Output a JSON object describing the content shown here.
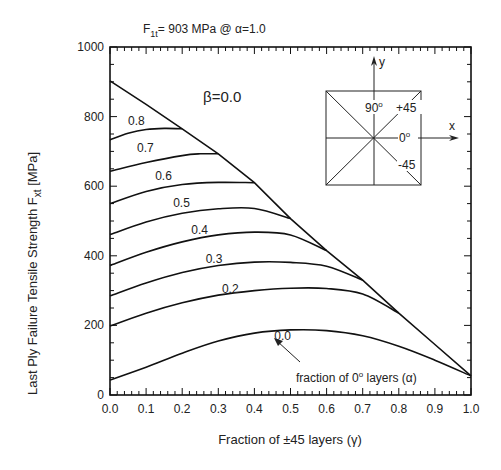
{
  "chart_data": {
    "type": "line",
    "title": "F1t= 903 MPa @ α=1.0",
    "title_parts": {
      "main": "F",
      "sub": "1t",
      "rest": "= 903 MPa @ α=1.0"
    },
    "xlabel": "Fraction of ±45 layers (γ)",
    "ylabel": "Last Ply Failure Tensile Strength  Fxt [MPa]",
    "ylabel_parts": {
      "main": "Last Ply Failure Tensile Strength  F",
      "sub": "xt",
      "rest": " [MPa]"
    },
    "xlim": [
      0.0,
      1.0
    ],
    "ylim": [
      0,
      1000
    ],
    "x_ticks": [
      "0.0",
      "0.1",
      "0.2",
      "0.3",
      "0.4",
      "0.5",
      "0.6",
      "0.7",
      "0.8",
      "0.9",
      "1.0"
    ],
    "y_ticks": [
      "0",
      "200",
      "400",
      "600",
      "800",
      "1000"
    ],
    "grid": false,
    "annotations": {
      "beta": "β=0.0",
      "alpha_note_prefix": "fraction of 0",
      "alpha_note_sup": "o",
      "alpha_note_suffix": " layers (α)"
    },
    "inset": {
      "y_axis": "y",
      "x_axis": "x",
      "label_90": "90",
      "label_90_sup": "o",
      "label_p45": "+45",
      "label_0": "0",
      "label_0_sup": "o",
      "label_m45": "-45"
    },
    "series": [
      {
        "name": "boundary (β=0.0)",
        "label": "",
        "x": [
          0.0,
          0.1,
          0.2,
          0.3,
          0.4,
          0.5,
          0.6,
          0.7,
          0.8,
          0.9,
          1.0
        ],
        "values": [
          903,
          835,
          765,
          693,
          610,
          507,
          415,
          330,
          235,
          145,
          55
        ]
      },
      {
        "name": "α=0.8",
        "label": "0.8",
        "x": [
          0.0,
          0.05,
          0.1,
          0.15,
          0.2
        ],
        "values": [
          733,
          752,
          763,
          766,
          765
        ]
      },
      {
        "name": "α=0.7",
        "label": "0.7",
        "x": [
          0.0,
          0.1,
          0.2,
          0.25,
          0.3
        ],
        "values": [
          643,
          668,
          688,
          693,
          693
        ]
      },
      {
        "name": "α=0.6",
        "label": "0.6",
        "x": [
          0.0,
          0.1,
          0.2,
          0.3,
          0.4
        ],
        "values": [
          550,
          585,
          605,
          611,
          610
        ]
      },
      {
        "name": "α=0.5",
        "label": "0.5",
        "x": [
          0.0,
          0.1,
          0.2,
          0.3,
          0.4,
          0.5
        ],
        "values": [
          461,
          497,
          522,
          535,
          536,
          507
        ]
      },
      {
        "name": "α=0.4",
        "label": "0.4",
        "x": [
          0.0,
          0.1,
          0.2,
          0.3,
          0.4,
          0.5,
          0.6
        ],
        "values": [
          372,
          410,
          440,
          460,
          468,
          460,
          415
        ]
      },
      {
        "name": "α=0.3",
        "label": "0.3",
        "x": [
          0.0,
          0.1,
          0.2,
          0.3,
          0.4,
          0.5,
          0.6,
          0.7
        ],
        "values": [
          285,
          322,
          352,
          372,
          382,
          381,
          370,
          330
        ]
      },
      {
        "name": "α=0.2",
        "label": "0.2",
        "x": [
          0.0,
          0.1,
          0.2,
          0.3,
          0.4,
          0.5,
          0.6,
          0.7,
          0.8
        ],
        "values": [
          198,
          235,
          265,
          287,
          300,
          307,
          306,
          290,
          235
        ]
      },
      {
        "name": "α=0.0",
        "label": "0.0",
        "x": [
          0.0,
          0.1,
          0.2,
          0.3,
          0.4,
          0.5,
          0.6,
          0.7,
          0.8,
          0.9,
          1.0
        ],
        "values": [
          43,
          80,
          120,
          155,
          178,
          187,
          185,
          170,
          140,
          100,
          55
        ]
      }
    ],
    "series_label_positions": [
      {
        "label": "0.8",
        "x": 0.05,
        "y": 775
      },
      {
        "label": "0.7",
        "x": 0.075,
        "y": 698
      },
      {
        "label": "0.6",
        "x": 0.125,
        "y": 617
      },
      {
        "label": "0.5",
        "x": 0.175,
        "y": 540
      },
      {
        "label": "0.4",
        "x": 0.225,
        "y": 464
      },
      {
        "label": "0.3",
        "x": 0.265,
        "y": 378
      },
      {
        "label": "0.2",
        "x": 0.31,
        "y": 293
      },
      {
        "label": "0.0",
        "x": 0.455,
        "y": 157
      }
    ]
  }
}
